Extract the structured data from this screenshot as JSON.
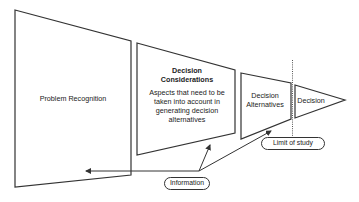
{
  "diagram": {
    "type": "decision-funnel",
    "stages": [
      {
        "id": "problem-recognition",
        "label": "Problem Recognition"
      },
      {
        "id": "decision-considerations",
        "title": "Decision Considerations",
        "description": "Aspects that need to be taken into account in generating decision alternatives"
      },
      {
        "id": "decision-alternatives",
        "label": "Decision Alternatives"
      },
      {
        "id": "decision",
        "label": "Decision"
      }
    ],
    "annotations": {
      "information": "Information",
      "limit_of_study": "Limit of study"
    },
    "connections": [
      {
        "from": "Information",
        "to": "Problem Recognition"
      },
      {
        "from": "Information",
        "to": "Decision Considerations"
      },
      {
        "from": "Information",
        "to": "Decision Alternatives"
      }
    ],
    "colors": {
      "stroke": "#333333",
      "background": "#ffffff",
      "text": "#222222"
    }
  }
}
